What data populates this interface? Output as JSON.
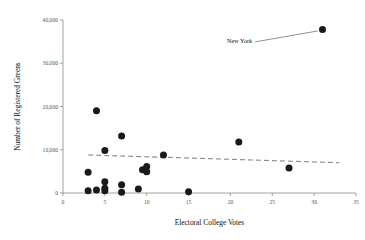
{
  "chart_data": {
    "type": "scatter",
    "title": "",
    "xlabel": "Electoral College Votes",
    "ylabel": "Number of Registered Greens",
    "xlim": [
      0,
      35
    ],
    "ylim": [
      0,
      40000
    ],
    "xticks": [
      "0",
      "5",
      "10",
      "15",
      "20",
      "25",
      "30",
      "35"
    ],
    "xtick_values": [
      0,
      5,
      10,
      15,
      20,
      25,
      30,
      35
    ],
    "yticks": [
      "0",
      "10,000",
      "20,000",
      "30,000",
      "40,000"
    ],
    "ytick_values": [
      0,
      10000,
      20000,
      30000,
      40000
    ],
    "grid": false,
    "legend": null,
    "marker_color": "#1a1a1a",
    "axis_color": "#8c8c8c",
    "trendline_color": "#8c8c8c",
    "points": [
      {
        "x": 31,
        "y": 37800,
        "label": "New York"
      },
      {
        "x": 4,
        "y": 19000,
        "label": ""
      },
      {
        "x": 7,
        "y": 13200,
        "label": ""
      },
      {
        "x": 21,
        "y": 11800,
        "label": ""
      },
      {
        "x": 5,
        "y": 9800,
        "label": ""
      },
      {
        "x": 12,
        "y": 8800,
        "label": ""
      },
      {
        "x": 10,
        "y": 6100,
        "label": ""
      },
      {
        "x": 27,
        "y": 5800,
        "label": ""
      },
      {
        "x": 9.5,
        "y": 5400,
        "label": ""
      },
      {
        "x": 10,
        "y": 4900,
        "label": ""
      },
      {
        "x": 3,
        "y": 4800,
        "label": ""
      },
      {
        "x": 5,
        "y": 2600,
        "label": ""
      },
      {
        "x": 7,
        "y": 1900,
        "label": ""
      },
      {
        "x": 9,
        "y": 900,
        "label": ""
      },
      {
        "x": 3,
        "y": 500,
        "label": ""
      },
      {
        "x": 4,
        "y": 700,
        "label": ""
      },
      {
        "x": 5,
        "y": 500,
        "label": ""
      },
      {
        "x": 5,
        "y": 1100,
        "label": ""
      },
      {
        "x": 7,
        "y": 200,
        "label": ""
      },
      {
        "x": 15,
        "y": 300,
        "label": ""
      }
    ],
    "trendline": {
      "x0": 3,
      "y0": 8800,
      "x1": 33,
      "y1": 7000,
      "style": "dashed"
    },
    "annotations": [
      {
        "text": "New York",
        "point_x": 31,
        "point_y": 37800,
        "text_x": 22.6,
        "text_y": 34600
      }
    ]
  }
}
